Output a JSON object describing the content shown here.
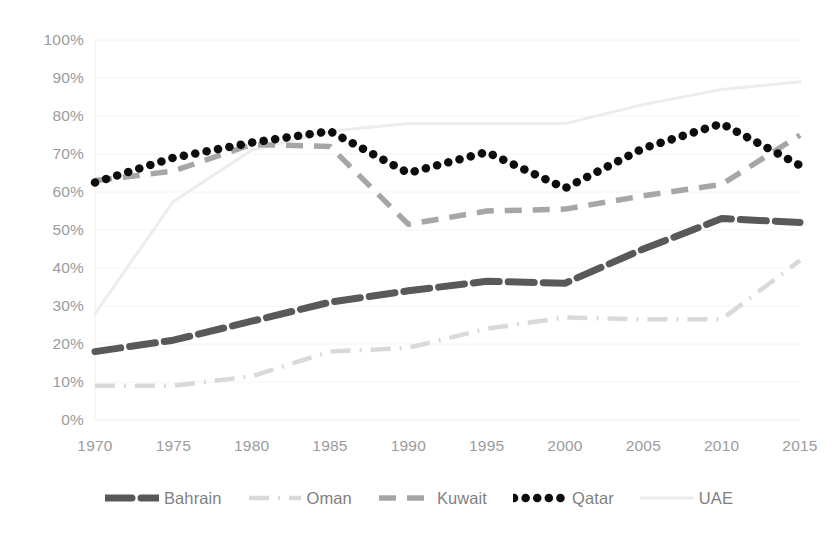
{
  "chart_data": {
    "type": "line",
    "title": "",
    "subtitle": "",
    "xlabel": "",
    "ylabel": "",
    "x": [
      1970,
      1975,
      1980,
      1985,
      1990,
      1995,
      2000,
      2005,
      2010,
      2015
    ],
    "categories": [
      "1970",
      "1975",
      "1980",
      "1985",
      "1990",
      "1995",
      "2000",
      "2005",
      "2010",
      "2015"
    ],
    "xlim": [
      1970,
      2015
    ],
    "ylim": [
      0,
      100
    ],
    "ytick_labels": [
      "0%",
      "10%",
      "20%",
      "30%",
      "40%",
      "50%",
      "60%",
      "70%",
      "80%",
      "90%",
      "100%"
    ],
    "ytick_values": [
      0,
      10,
      20,
      30,
      40,
      50,
      60,
      70,
      80,
      90,
      100
    ],
    "yunit": "%",
    "grid": true,
    "grid_axis": "y",
    "legend_position": "bottom",
    "series": [
      {
        "name": "Bahrain",
        "color": "#595959",
        "style": "dashed-with-dot-marker",
        "values": [
          18,
          21,
          26,
          31,
          34,
          36.5,
          36,
          45,
          53,
          52
        ]
      },
      {
        "name": "Oman",
        "color": "#d9d9d9",
        "style": "dash-dot",
        "values": [
          9,
          9,
          11.5,
          18,
          19,
          24,
          27,
          26.5,
          26.5,
          42
        ]
      },
      {
        "name": "Kuwait",
        "color": "#a6a6a6",
        "style": "dashed",
        "values": [
          63,
          65.5,
          72.5,
          72,
          51.5,
          55,
          55.5,
          59,
          62,
          75
        ]
      },
      {
        "name": "Qatar",
        "color": "#0d0d0d",
        "style": "dotted",
        "values": [
          62.5,
          69,
          73,
          76,
          65,
          70.5,
          61,
          71.5,
          78,
          67
        ]
      },
      {
        "name": "UAE",
        "color": "#ececec",
        "style": "solid-faint",
        "values": [
          28,
          57.5,
          71,
          76,
          78,
          78,
          78,
          83,
          87,
          89
        ]
      }
    ]
  },
  "legend": {
    "items": [
      {
        "label": "Bahrain",
        "icon": "dashed-line-swatch"
      },
      {
        "label": "Oman",
        "icon": "dash-dot-line-swatch"
      },
      {
        "label": "Kuwait",
        "icon": "dashed-line-swatch"
      },
      {
        "label": "Qatar",
        "icon": "dotted-line-swatch"
      },
      {
        "label": "UAE",
        "icon": "faint-line-swatch"
      }
    ]
  },
  "colors": {
    "background": "#ffffff",
    "axis_text": "#9b9b9b",
    "legend_text": "#7f7f7f",
    "gridline": "#f4f4f4"
  }
}
